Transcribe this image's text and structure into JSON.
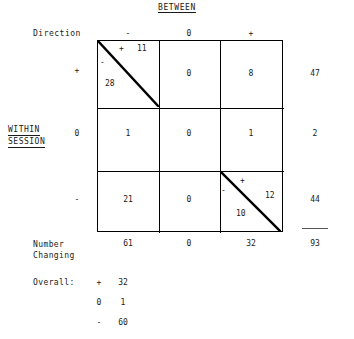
{
  "headings": {
    "between": "BETWEEN",
    "direction": "Direction",
    "within_session_line1": "WITHIN",
    "within_session_line2": "SESSION"
  },
  "column_headers": [
    "-",
    "0",
    "+"
  ],
  "row_headers": [
    "+",
    "0",
    "-"
  ],
  "table": {
    "r0c0": {
      "split": true,
      "plus_sign": "+",
      "plus_value": "11",
      "minus_sign": "-",
      "minus_value": "28"
    },
    "r0c1": "0",
    "r0c2": "8",
    "r1c0": "1",
    "r1c1": "0",
    "r1c2": "1",
    "r2c0": "21",
    "r2c1": "0",
    "r2c2": {
      "split": true,
      "plus_sign": "+",
      "plus_value": "12",
      "minus_sign": "-",
      "minus_value": "10"
    }
  },
  "row_totals": [
    "47",
    "2",
    "44"
  ],
  "column_totals": [
    "61",
    "0",
    "32"
  ],
  "grand_total": "93",
  "number_changing": {
    "line1": "Number",
    "line2": "Changing"
  },
  "overall": {
    "label": "Overall:",
    "rows": [
      {
        "sign": "+",
        "value": "32"
      },
      {
        "sign": "0",
        "value": "1"
      },
      {
        "sign": "-",
        "value": "60"
      }
    ]
  },
  "colors": {
    "ink": "#1a1a1a",
    "rule": "#000000",
    "background": "#ffffff"
  }
}
